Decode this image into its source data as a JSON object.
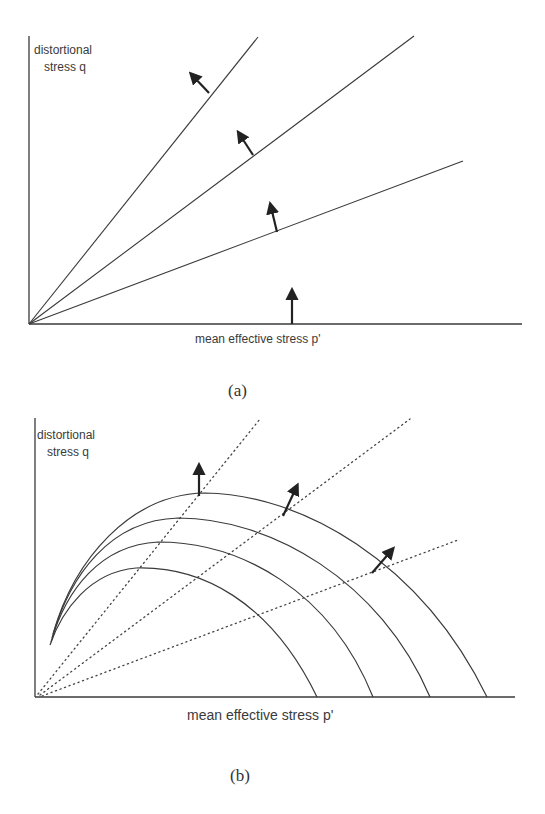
{
  "figure": {
    "panel_a": {
      "label": "(a)",
      "y_axis_label_line1": "distortional",
      "y_axis_label_line2": "stress q",
      "x_axis_label": "mean effective stress p'",
      "axes": {
        "origin": [
          29,
          324
        ],
        "y_top": 36,
        "x_right": 522
      },
      "rays": [
        {
          "name": "steep",
          "end": [
            258,
            37
          ]
        },
        {
          "name": "middle",
          "end": [
            414,
            36
          ]
        },
        {
          "name": "shallow",
          "end": [
            463,
            161
          ]
        }
      ],
      "arrows": [
        {
          "from": [
            209,
            93
          ],
          "to": [
            193,
            76
          ]
        },
        {
          "from": [
            253,
            155
          ],
          "to": [
            240,
            135
          ]
        },
        {
          "from": [
            277,
            232
          ],
          "to": [
            271,
            207
          ]
        },
        {
          "from": [
            292,
            324
          ],
          "to": [
            292,
            293
          ]
        }
      ]
    },
    "panel_b": {
      "label": "(b)",
      "y_axis_label_line1": "distortional",
      "y_axis_label_line2": "stress q",
      "x_axis_label": "mean effective stress p'",
      "axes": {
        "origin": [
          35,
          697
        ],
        "y_top": 418,
        "x_right": 515
      },
      "dotted_rays": [
        {
          "name": "steep",
          "start": [
            38,
            694
          ],
          "end": [
            260,
            419
          ]
        },
        {
          "name": "middle",
          "start": [
            40,
            695
          ],
          "end": [
            410,
            419
          ]
        },
        {
          "name": "shallow",
          "start": [
            42,
            696
          ],
          "end": [
            458,
            540
          ]
        }
      ],
      "yield_curves": [
        {
          "name": "curve-1-inner",
          "path": "M50,645 C62,610 90,572 136,568 C200,566 270,600 317,697"
        },
        {
          "name": "curve-2",
          "path": "M51,642 C66,590 100,545 158,542 C240,542 330,590 373,697"
        },
        {
          "name": "curve-3",
          "path": "M52,638 C70,575 110,520 178,518 C270,518 380,580 430,697"
        },
        {
          "name": "curve-4-outer",
          "path": "M53,634 C74,560 130,494 205,493 C300,494 420,560 487,697"
        }
      ],
      "arrows": [
        {
          "from": [
            199,
            496
          ],
          "to": [
            199,
            468
          ]
        },
        {
          "from": [
            283,
            516
          ],
          "to": [
            296,
            488
          ]
        },
        {
          "from": [
            372,
            573
          ],
          "to": [
            391,
            551
          ]
        }
      ]
    },
    "colors": {
      "line": "#3a3a3a",
      "arrow": "#222222",
      "background": "#ffffff"
    }
  }
}
